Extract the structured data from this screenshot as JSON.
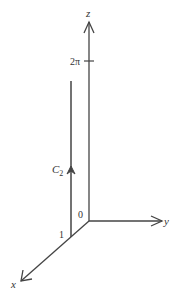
{
  "diagram": {
    "type": "3d-axes-curve",
    "axes": {
      "x_label": "x",
      "y_label": "y",
      "z_label": "z"
    },
    "origin_label": "0",
    "tick_labels": {
      "z_tick": "2π",
      "x_tick": "1"
    },
    "curve": {
      "label": "C",
      "subscript": "2",
      "direction": "upward"
    },
    "colors": {
      "line": "#444444",
      "text": "#333333",
      "background": "#ffffff"
    }
  }
}
